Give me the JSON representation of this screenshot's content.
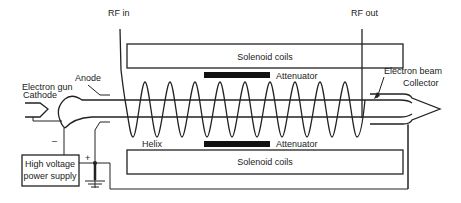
{
  "diagram": {
    "labels": {
      "rf_in": "RF in",
      "rf_out": "RF out",
      "solenoid_top": "Solenoid coils",
      "solenoid_bottom": "Solenoid coils",
      "attenuator_top": "Attenuator",
      "attenuator_bottom": "Attenuator",
      "electron_gun": "Electron gun",
      "cathode": "Cathode",
      "anode": "Anode",
      "helix": "Helix",
      "electron_beam": "Electron beam",
      "collector": "Collector",
      "minus": "–",
      "plus": "+",
      "power_supply_line1": "High voltage",
      "power_supply_line2": "power supply"
    },
    "helix_turns": 10,
    "colors": {
      "line": "#222222",
      "attenuator": "#111111",
      "background": "#ffffff"
    }
  }
}
